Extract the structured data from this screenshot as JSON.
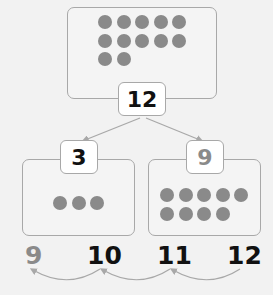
{
  "whole": {
    "value": "12",
    "dot_count": 12
  },
  "parts": [
    {
      "value": "3",
      "dot_count": 3,
      "style": "bold"
    },
    {
      "value": "9",
      "dot_count": 9,
      "style": "light"
    }
  ],
  "number_line": [
    {
      "value": "9",
      "style": "light"
    },
    {
      "value": "10",
      "style": "bold"
    },
    {
      "value": "11",
      "style": "bold"
    },
    {
      "value": "12",
      "style": "bold"
    }
  ],
  "colors": {
    "dot": "#8a8a8a",
    "border": "#a8a8a8",
    "text": "#111111",
    "light_text": "#8a8a8a",
    "background": "#f2f2f2"
  }
}
